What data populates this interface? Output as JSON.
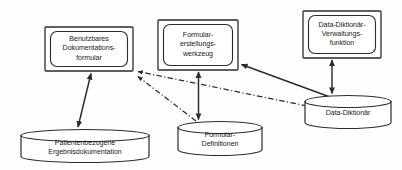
{
  "diagram": {
    "background_color": "#fdfdfd",
    "stroke_color": "#2b2b2b",
    "text_color": "#1a1a1a",
    "process_nodes": [
      {
        "id": "benutzbares-dokumentationsformular",
        "label": "Benutzbares\nDokumentations-\nformular",
        "shape": "double-rounded-rect",
        "x": 45,
        "y": 27,
        "width": 88,
        "height": 44
      },
      {
        "id": "formular-erstellungswerkzeug",
        "label": "Formular-\nerstellungs-\nwerkzeug",
        "shape": "double-rounded-rect",
        "x": 158,
        "y": 20,
        "width": 80,
        "height": 50
      },
      {
        "id": "data-diktionaer-verwaltungsfunktion",
        "label": "Data-Diktionär-\nVerwaltungs-\nfunktion",
        "shape": "double-rounded-rect",
        "x": 303,
        "y": 11,
        "width": 78,
        "height": 47
      }
    ],
    "datastore_nodes": [
      {
        "id": "patientenbezogene-ergebnisdokumentation",
        "label": "Patientenbezogene\nErgebnisdokumentation",
        "shape": "cylinder",
        "x": 21,
        "y": 130,
        "width": 128,
        "height": 32
      },
      {
        "id": "formular-definitionen",
        "label": "Formular-\nDefinitionen",
        "shape": "cylinder",
        "x": 178,
        "y": 122,
        "width": 84,
        "height": 34
      },
      {
        "id": "data-diktionaer",
        "label": "Data-Diktionär",
        "shape": "cylinder",
        "x": 305,
        "y": 96,
        "width": 86,
        "height": 33
      }
    ],
    "connections": [
      {
        "id": "form-to-patientendaten",
        "from": "benutzbares-dokumentationsformular",
        "to": "patientenbezogene-ergebnisdokumentation",
        "style": "solid",
        "arrows": "both"
      },
      {
        "id": "werkzeug-to-formulardefinitionen",
        "from": "formular-erstellungswerkzeug",
        "to": "formular-definitionen",
        "style": "solid",
        "arrows": "both"
      },
      {
        "id": "verwaltung-to-diktionaer",
        "from": "data-diktionaer-verwaltungsfunktion",
        "to": "data-diktionaer",
        "style": "solid",
        "arrows": "both"
      },
      {
        "id": "diktionaer-to-werkzeug",
        "from": "data-diktionaer",
        "to": "formular-erstellungswerkzeug",
        "style": "solid",
        "arrows": "to"
      },
      {
        "id": "diktionaer-to-dokumentationsformular",
        "from": "data-diktionaer",
        "to": "benutzbares-dokumentationsformular",
        "style": "dash-dot",
        "arrows": "to"
      },
      {
        "id": "formulardefinitionen-to-dokumentationsformular",
        "from": "formular-definitionen",
        "to": "benutzbares-dokumentationsformular",
        "style": "dash-dot",
        "arrows": "to"
      }
    ]
  }
}
